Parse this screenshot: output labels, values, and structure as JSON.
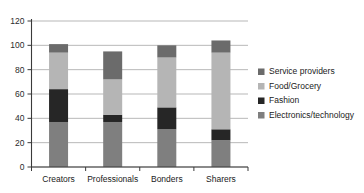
{
  "chart_data": {
    "type": "bar",
    "stacked": true,
    "title": "",
    "subtitle": "",
    "xlabel": "",
    "ylabel": "",
    "ylim": [
      0,
      120
    ],
    "ytick_values": [
      0,
      20,
      40,
      60,
      80,
      100,
      120
    ],
    "ytick_labels": [
      "0",
      "20",
      "40",
      "60",
      "80",
      "100",
      "120"
    ],
    "grid": true,
    "grid_axis": "y",
    "legend_position": "right",
    "categories": [
      "Creators",
      "Professionals",
      "Bonders",
      "Sharers"
    ],
    "series": [
      {
        "name": "Electronics/technology",
        "color": "#7f7f7f",
        "values": [
          37,
          37,
          31,
          22
        ]
      },
      {
        "name": "Fashion",
        "color": "#262626",
        "values": [
          27,
          6,
          18,
          9
        ]
      },
      {
        "name": "Food/Grocery",
        "color": "#b5b5b5",
        "values": [
          30,
          29,
          41,
          63
        ]
      },
      {
        "name": "Service providers",
        "color": "#6b6b6b",
        "values": [
          7,
          23,
          10,
          10
        ]
      }
    ],
    "stack_order_bottom_to_top": [
      "Electronics/technology",
      "Fashion",
      "Food/Grocery",
      "Service providers"
    ],
    "totals": [
      101,
      95,
      100,
      104
    ],
    "legend_entries": [
      {
        "label": "Service providers",
        "color": "#6b6b6b"
      },
      {
        "label": "Food/Grocery",
        "color": "#b5b5b5"
      },
      {
        "label": "Fashion",
        "color": "#262626"
      },
      {
        "label": "Electronics/technology",
        "color": "#7f7f7f"
      }
    ]
  }
}
